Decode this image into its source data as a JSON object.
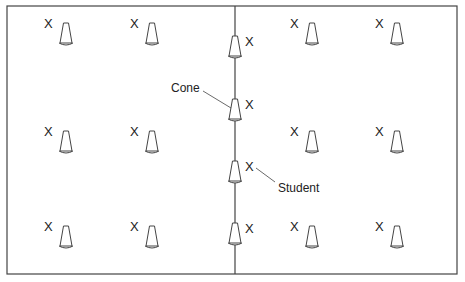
{
  "diagram": {
    "type": "field-layout",
    "labels": {
      "cone": "Cone",
      "student": "Student"
    },
    "student_marker": "X",
    "colors": {
      "line": "#444444",
      "text": "#222222",
      "background": "#ffffff"
    },
    "left_cones": [
      {
        "x": 66,
        "y": 37
      },
      {
        "x": 152,
        "y": 37
      },
      {
        "x": 66,
        "y": 145
      },
      {
        "x": 152,
        "y": 145
      },
      {
        "x": 66,
        "y": 240
      },
      {
        "x": 152,
        "y": 240
      }
    ],
    "center_cones": [
      {
        "x": 235,
        "y": 50
      },
      {
        "x": 235,
        "y": 113
      },
      {
        "x": 235,
        "y": 175
      },
      {
        "x": 235,
        "y": 237
      }
    ],
    "right_cones": [
      {
        "x": 312,
        "y": 37
      },
      {
        "x": 397,
        "y": 37
      },
      {
        "x": 312,
        "y": 145
      },
      {
        "x": 397,
        "y": 145
      },
      {
        "x": 312,
        "y": 240
      },
      {
        "x": 397,
        "y": 240
      }
    ]
  }
}
